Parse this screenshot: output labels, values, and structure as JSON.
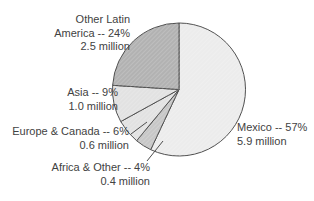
{
  "chart_data": {
    "type": "pie",
    "title": "",
    "start_angle_deg": 0,
    "direction": "clockwise",
    "units": "millions",
    "slices": [
      {
        "name": "Mexico",
        "percent": 57,
        "value_millions": 5.9,
        "label_lines": [
          "Mexico -- 57%",
          "5.9 million"
        ],
        "color": "#ececec"
      },
      {
        "name": "Africa & Other",
        "percent": 4,
        "value_millions": 0.4,
        "label_lines": [
          "Africa & Other -- 4%",
          "0.4 million"
        ],
        "color": "#c7c7c7"
      },
      {
        "name": "Europe & Canada",
        "percent": 6,
        "value_millions": 0.6,
        "label_lines": [
          "Europe & Canada -- 6%",
          "0.6 million"
        ],
        "color": "#e2e2e2"
      },
      {
        "name": "Asia",
        "percent": 9,
        "value_millions": 1.0,
        "label_lines": [
          "Asia -- 9%",
          "1.0 million"
        ],
        "color": "#e2e2e2"
      },
      {
        "name": "Other Latin America",
        "percent": 24,
        "value_millions": 2.5,
        "label_lines": [
          "Other Latin",
          "America -- 24%",
          "2.5 million"
        ],
        "color": "#b2b2b2"
      }
    ],
    "outline_color": "#4d4d4d",
    "leader_line_color": "#4d4d4d",
    "text_color": "#424242",
    "legend": "none",
    "labels_position": "outside"
  }
}
